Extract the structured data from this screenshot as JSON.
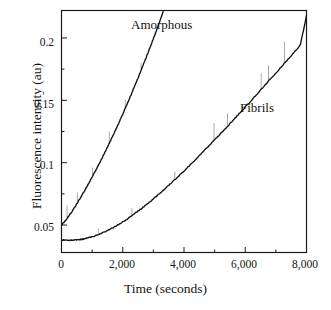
{
  "figure": {
    "background_color": "#ffffff",
    "frame_color": "#1a1a1a",
    "curve_color": "#111111",
    "noise_color": "#9a9a9a"
  },
  "chart_data": {
    "type": "line",
    "title": "",
    "xlabel": "Time (seconds)",
    "ylabel": "Fluorescence intensity (au)",
    "xlim": [
      0,
      8000
    ],
    "ylim": [
      0.028,
      0.222
    ],
    "grid": false,
    "legend_position": "inline-annotation",
    "x_ticks": [
      0,
      2000,
      4000,
      6000,
      8000
    ],
    "x_tick_labels": [
      "0",
      "2,000",
      "4,000",
      "6,000",
      "8,000"
    ],
    "x_minor_tick_interval": 1000,
    "y_ticks": [
      0.05,
      0.1,
      0.15,
      0.2
    ],
    "y_tick_labels": [
      "0.05",
      "0.1",
      "0.15",
      "0.2"
    ],
    "y_minor_tick_interval": 0.025,
    "series": [
      {
        "name": "Amorphous",
        "label_x": 2750,
        "label_y": 0.2155,
        "clipped_at_top": true,
        "points": [
          [
            0,
            0.05
          ],
          [
            60,
            0.0516
          ],
          [
            120,
            0.0534
          ],
          [
            180,
            0.0553
          ],
          [
            240,
            0.0573
          ],
          [
            300,
            0.0594
          ],
          [
            400,
            0.0631
          ],
          [
            500,
            0.067
          ],
          [
            600,
            0.0711
          ],
          [
            700,
            0.0753
          ],
          [
            800,
            0.0796
          ],
          [
            900,
            0.084
          ],
          [
            1000,
            0.0885
          ],
          [
            1100,
            0.0931
          ],
          [
            1200,
            0.0978
          ],
          [
            1300,
            0.1026
          ],
          [
            1400,
            0.1075
          ],
          [
            1500,
            0.1125
          ],
          [
            1600,
            0.1176
          ],
          [
            1700,
            0.1228
          ],
          [
            1800,
            0.1281
          ],
          [
            1900,
            0.1335
          ],
          [
            2000,
            0.139
          ],
          [
            2100,
            0.1446
          ],
          [
            2200,
            0.1503
          ],
          [
            2300,
            0.1561
          ],
          [
            2400,
            0.162
          ],
          [
            2500,
            0.168
          ],
          [
            2600,
            0.1741
          ],
          [
            2700,
            0.1803
          ],
          [
            2800,
            0.1866
          ],
          [
            2900,
            0.193
          ],
          [
            3000,
            0.1995
          ],
          [
            3100,
            0.2061
          ],
          [
            3200,
            0.2128
          ],
          [
            3260,
            0.2169
          ],
          [
            3320,
            0.221
          ]
        ],
        "noise_spikes": [
          {
            "x": 180,
            "height": 0.0105
          },
          {
            "x": 520,
            "height": 0.0082
          },
          {
            "x": 1010,
            "height": 0.0072
          },
          {
            "x": 1560,
            "height": 0.0095
          },
          {
            "x": 2080,
            "height": 0.0068
          },
          {
            "x": 2600,
            "height": 0.006
          }
        ]
      },
      {
        "name": "Fibrils",
        "label_x": 6050,
        "label_y": 0.148,
        "clipped_at_top": false,
        "points": [
          [
            0,
            0.038
          ],
          [
            100,
            0.0379
          ],
          [
            200,
            0.0378
          ],
          [
            300,
            0.0378
          ],
          [
            400,
            0.0379
          ],
          [
            500,
            0.0381
          ],
          [
            600,
            0.0384
          ],
          [
            700,
            0.0388
          ],
          [
            800,
            0.0393
          ],
          [
            900,
            0.0399
          ],
          [
            1000,
            0.0406
          ],
          [
            1200,
            0.0423
          ],
          [
            1400,
            0.0444
          ],
          [
            1600,
            0.0468
          ],
          [
            1800,
            0.0495
          ],
          [
            2000,
            0.0525
          ],
          [
            2200,
            0.0558
          ],
          [
            2400,
            0.0593
          ],
          [
            2600,
            0.063
          ],
          [
            2800,
            0.0669
          ],
          [
            3000,
            0.071
          ],
          [
            3200,
            0.0752
          ],
          [
            3400,
            0.0796
          ],
          [
            3600,
            0.0841
          ],
          [
            3800,
            0.0887
          ],
          [
            4000,
            0.0934
          ],
          [
            4200,
            0.0982
          ],
          [
            4400,
            0.1031
          ],
          [
            4600,
            0.1081
          ],
          [
            4800,
            0.1131
          ],
          [
            5000,
            0.1182
          ],
          [
            5200,
            0.1234
          ],
          [
            5400,
            0.1286
          ],
          [
            5600,
            0.1339
          ],
          [
            5800,
            0.1392
          ],
          [
            6000,
            0.1446
          ],
          [
            6200,
            0.15
          ],
          [
            6400,
            0.1554
          ],
          [
            6600,
            0.1609
          ],
          [
            6800,
            0.1664
          ],
          [
            7000,
            0.1719
          ],
          [
            7200,
            0.1775
          ],
          [
            7400,
            0.1831
          ],
          [
            7600,
            0.1887
          ],
          [
            7800,
            0.1943
          ],
          [
            8000,
            0.218
          ]
        ],
        "noise_spikes": [
          {
            "x": 1200,
            "height": 0.005
          },
          {
            "x": 2300,
            "height": 0.006
          },
          {
            "x": 3700,
            "height": 0.0065
          },
          {
            "x": 4980,
            "height": 0.014
          },
          {
            "x": 5420,
            "height": 0.0105
          },
          {
            "x": 6520,
            "height": 0.0128
          },
          {
            "x": 6760,
            "height": 0.0128
          },
          {
            "x": 7280,
            "height": 0.0175
          }
        ]
      }
    ]
  }
}
